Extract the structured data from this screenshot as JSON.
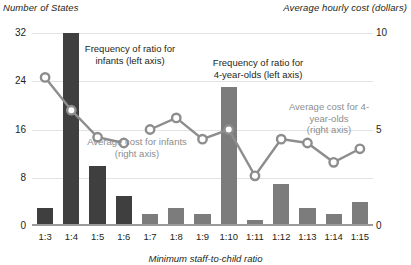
{
  "axis_titles": {
    "left": "Number of States",
    "right": "Average hourly cost (dollars)",
    "x": "Minimum staff-to-child ratio"
  },
  "annotations": {
    "infant_bars": "Frequency of ratio for\ninfants (left axis)",
    "four_bars": "Frequency of ratio for\n4-year-olds (left axis)",
    "infant_line": "Average cost for infants\n(right axis)",
    "four_line": "Average cost for 4-\nyear-olds\n(right axis)"
  },
  "colors": {
    "bar_infant": "#3f3f3f",
    "bar_four": "#7c7c7c",
    "line": "#8d8d8d",
    "gridline": "#e3e3e3",
    "text": "#231f20"
  },
  "chart_data": {
    "type": "bar",
    "title": "",
    "xlabel": "Minimum staff-to-child ratio",
    "ylabel": "Number of States",
    "y2label": "Average hourly cost (dollars)",
    "ylim": [
      0,
      32
    ],
    "y2lim": [
      0,
      10
    ],
    "yticks": [
      0,
      8,
      16,
      24,
      32
    ],
    "y2ticks": [
      0,
      5,
      10
    ],
    "grid": true,
    "legend": "annotations",
    "categories": [
      "1:3",
      "1:4",
      "1:5",
      "1:6",
      "1:7",
      "1:8",
      "1:9",
      "1:10",
      "1:11",
      "1:12",
      "1:13",
      "1:14",
      "1:15"
    ],
    "series": [
      {
        "name": "Frequency of ratio for infants (left axis)",
        "type": "bar",
        "axis": "left",
        "color": "#3f3f3f",
        "values": [
          3,
          32,
          10,
          5,
          null,
          null,
          null,
          null,
          null,
          null,
          null,
          null,
          null
        ]
      },
      {
        "name": "Frequency of ratio for 4-year-olds (left axis)",
        "type": "bar",
        "axis": "left",
        "color": "#7c7c7c",
        "values": [
          null,
          null,
          null,
          null,
          2,
          3,
          2,
          23,
          1,
          7,
          3,
          2,
          4
        ]
      },
      {
        "name": "Average cost for infants (right axis)",
        "type": "line",
        "axis": "right",
        "color": "#8d8d8d",
        "values": [
          7.7,
          6.0,
          4.6,
          4.3,
          null,
          null,
          null,
          null,
          null,
          null,
          null,
          null,
          null
        ]
      },
      {
        "name": "Average cost for 4-year-olds (right axis)",
        "type": "line",
        "axis": "right",
        "color": "#8d8d8d",
        "values": [
          null,
          null,
          null,
          null,
          5.0,
          5.6,
          4.5,
          5.0,
          2.6,
          4.5,
          4.3,
          3.3,
          4.0
        ]
      }
    ]
  }
}
